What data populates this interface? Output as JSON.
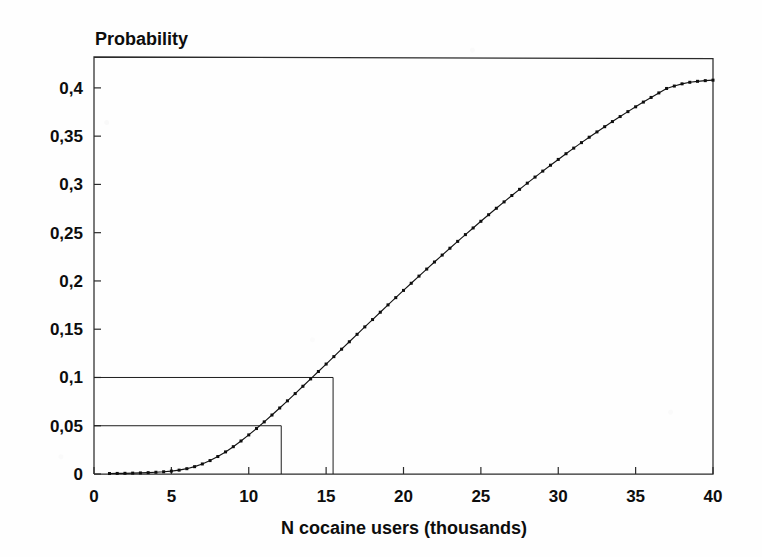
{
  "figure": {
    "background_color": "#fefefe",
    "ink_color": "#101010",
    "axis_color": "#2a2a2a"
  },
  "chart_data": {
    "type": "line",
    "title": "",
    "ylabel": "Probability",
    "xlabel": "N cocaine users (thousands)",
    "decimal_separator": ",",
    "xlim": [
      0,
      40
    ],
    "ylim": [
      0,
      0.432
    ],
    "grid": false,
    "legend": null,
    "marker": "square",
    "marker_size_px": 3,
    "xticks": [
      0,
      5,
      10,
      15,
      20,
      25,
      30,
      35,
      40
    ],
    "xtick_labels": [
      "0",
      "5",
      "10",
      "15",
      "20",
      "25",
      "30",
      "35",
      "40"
    ],
    "yticks": [
      0,
      0.05,
      0.1,
      0.15,
      0.2,
      0.25,
      0.3,
      0.35,
      0.4
    ],
    "ytick_labels": [
      "0",
      "0,05",
      "0,1",
      "0,15",
      "0,2",
      "0,25",
      "0,3",
      "0,35",
      "0,4"
    ],
    "x": [
      1.0,
      1.5,
      2.0,
      2.5,
      3.0,
      3.5,
      4.0,
      4.5,
      5.0,
      5.5,
      6.0,
      6.5,
      7.0,
      7.5,
      8.0,
      8.5,
      9.0,
      9.5,
      10.0,
      10.5,
      11.0,
      11.5,
      12.0,
      12.5,
      13.0,
      13.5,
      14.0,
      14.5,
      15.0,
      15.5,
      16.0,
      16.5,
      17.0,
      17.5,
      18.0,
      18.5,
      19.0,
      19.5,
      20.0,
      20.5,
      21.0,
      21.5,
      22.0,
      22.5,
      23.0,
      23.5,
      24.0,
      24.5,
      25.0,
      25.5,
      26.0,
      26.5,
      27.0,
      27.5,
      28.0,
      28.5,
      29.0,
      29.5,
      30.0,
      30.5,
      31.0,
      31.5,
      32.0,
      32.5,
      33.0,
      33.5,
      34.0,
      34.5,
      35.0,
      35.5,
      36.0,
      36.5,
      37.0,
      37.5,
      38.0,
      38.5,
      39.0,
      39.5,
      40.0
    ],
    "y": [
      0.0005,
      0.0006,
      0.0007,
      0.0009,
      0.0011,
      0.0014,
      0.0018,
      0.0023,
      0.003,
      0.004,
      0.0055,
      0.0076,
      0.0104,
      0.0139,
      0.0181,
      0.0229,
      0.0283,
      0.0342,
      0.0405,
      0.0471,
      0.054,
      0.0611,
      0.0684,
      0.0758,
      0.0833,
      0.0909,
      0.0985,
      0.1062,
      0.1139,
      0.1216,
      0.1293,
      0.137,
      0.1447,
      0.1524,
      0.16,
      0.1676,
      0.1752,
      0.1827,
      0.1902,
      0.1976,
      0.205,
      0.2123,
      0.2196,
      0.2268,
      0.2339,
      0.241,
      0.248,
      0.2549,
      0.2618,
      0.2686,
      0.2753,
      0.2819,
      0.2885,
      0.2949,
      0.3013,
      0.3076,
      0.3138,
      0.3199,
      0.3259,
      0.3318,
      0.3376,
      0.3433,
      0.3489,
      0.3544,
      0.3598,
      0.3651,
      0.3703,
      0.3754,
      0.3804,
      0.3853,
      0.3901,
      0.3948,
      0.3994,
      0.4019,
      0.4042,
      0.4058,
      0.4068,
      0.4075,
      0.408
    ],
    "annotations": [
      {
        "name": "reference-line-p005",
        "probability": 0.05,
        "probability_label": "0,05",
        "x_intersect": 12.1,
        "type": "reference-lines"
      },
      {
        "name": "reference-line-p010",
        "probability": 0.1,
        "probability_label": "0,1",
        "x_intersect": 15.45,
        "type": "reference-lines"
      }
    ]
  },
  "geometry": {
    "plot_left_px": 94,
    "plot_right_px": 713,
    "plot_top_px": 57,
    "plot_bottom_px": 474,
    "ylabel_x_px": 95,
    "ylabel_y_px": 45,
    "xlabel_x_px": 404,
    "xlabel_y_px": 534
  }
}
